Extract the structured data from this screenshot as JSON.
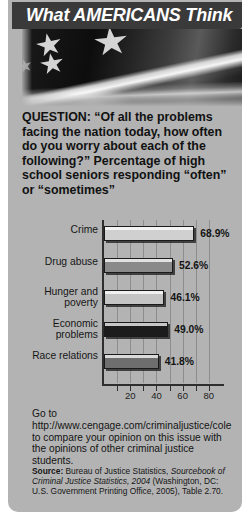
{
  "banner": {
    "part1": "What ",
    "part2": "AMERICANS",
    "part3": " Think",
    "full": "What AMERICANS Think",
    "background": "#3a3a3a",
    "text_color": "#ffffff"
  },
  "hero": {
    "image": "american-flag-grayscale"
  },
  "question": {
    "text": "QUESTION: “Of all the problems facing the nation today, how often do you worry about each of the following?” Percentage of high school seniors responding “often” or “sometimes”"
  },
  "chart_data": {
    "type": "bar",
    "orientation": "horizontal",
    "title": "",
    "xlabel": "",
    "ylabel": "",
    "xlim": [
      0,
      90
    ],
    "xticks": [
      20,
      40,
      60,
      80
    ],
    "xticks_minor": [
      10,
      30,
      50,
      70
    ],
    "grid": true,
    "categories": [
      "Crime",
      "Drug abuse",
      "Hunger and poverty",
      "Economic problems",
      "Race relations"
    ],
    "values": [
      68.9,
      52.6,
      46.1,
      49.0,
      41.8
    ],
    "value_labels": [
      "68.9%",
      "52.6%",
      "46.1%",
      "49.0%",
      "41.8%"
    ],
    "bar_colors": [
      "#d0d0d0",
      "#8a8a8a",
      "#c4c4c4",
      "#1c1c1c",
      "#6e6e6e"
    ]
  },
  "promo": {
    "text": "Go to http://www.cengage.com/criminaljustice/cole to compare your opinion on this issue with the opinions of other criminal justice students."
  },
  "source": {
    "label": "Source:",
    "text_before": " Bureau of Justice Statistics, ",
    "italic": "Sourcebook of Criminal Justice Statistics, 2004",
    "text_after": " (Washington, DC: U.S. Government Printing Office, 2005), Table 2.70."
  }
}
